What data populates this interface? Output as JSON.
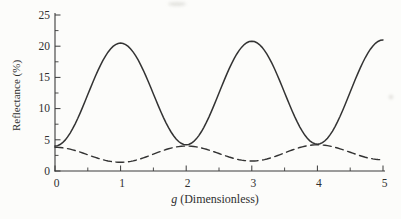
{
  "figure": {
    "paper_color": "#fcfcfa",
    "ink_color": "#3a3a3a",
    "curve_color": "#333333"
  },
  "chart_data": {
    "type": "line",
    "title": "",
    "xlabel": "g (Dimensionless)",
    "xlabel_var": "g",
    "xlabel_rest": " (Dimensionless)",
    "ylabel": "Reflectance (%)",
    "xlim": [
      0,
      5
    ],
    "ylim": [
      0,
      25
    ],
    "x_ticks_major": [
      0,
      1,
      2,
      3,
      4,
      5
    ],
    "x_ticks_minor": [
      0.5,
      1.5,
      2.5,
      3.5,
      4.5
    ],
    "y_ticks_major": [
      0,
      5,
      10,
      15,
      20,
      25
    ],
    "y_ticks_minor": [
      2.5,
      7.5,
      12.5,
      17.5,
      22.5
    ],
    "grid": false,
    "legend": "none",
    "interpolation": "cosine-between-extrema",
    "series": [
      {
        "name": "solid-curve",
        "style": "solid",
        "color": "#333333",
        "points": [
          [
            0,
            4.0
          ],
          [
            1,
            20.5
          ],
          [
            2,
            4.2
          ],
          [
            3,
            20.8
          ],
          [
            4,
            4.3
          ],
          [
            5,
            21.0
          ]
        ]
      },
      {
        "name": "dashed-curve",
        "style": "dashed",
        "color": "#333333",
        "points": [
          [
            0,
            3.8
          ],
          [
            1,
            1.4
          ],
          [
            2,
            4.0
          ],
          [
            3,
            1.6
          ],
          [
            4,
            4.2
          ],
          [
            5,
            1.8
          ]
        ]
      }
    ]
  }
}
